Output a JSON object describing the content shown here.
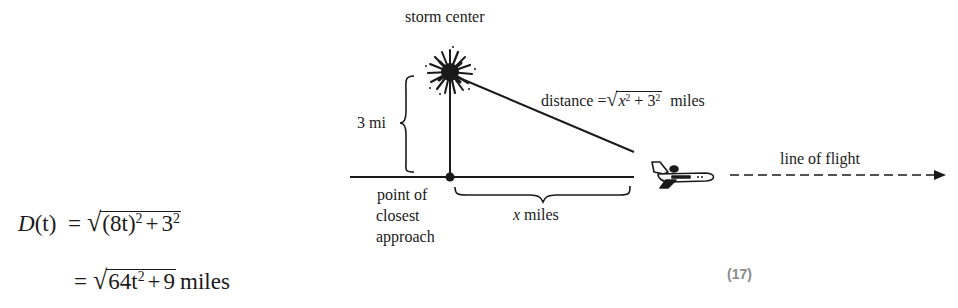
{
  "diagram": {
    "storm_label": "storm center",
    "vertical_distance_label": "3 mi",
    "distance_label_prefix": "distance =",
    "distance_radicand": {
      "x": "x",
      "x_exp": "2",
      "plus": "+",
      "three": "3",
      "three_exp": "2"
    },
    "distance_label_suffix": "miles",
    "closest_point_label": [
      "point of",
      "closest",
      "approach"
    ],
    "horizontal_distance_label": {
      "var": "x",
      "unit": "miles"
    },
    "flight_label": "line of flight",
    "icons": {
      "storm": "storm-burst-icon",
      "plane": "airplane-icon",
      "arrow": "arrow-right-icon"
    },
    "colors": {
      "ink": "#1a1a1a",
      "equation_number": "#8a8a8a",
      "background": "#ffffff"
    }
  },
  "equations": {
    "line1": {
      "lhs": "D",
      "lhs_arg": "(t)",
      "equals": "=",
      "radicand_a": "(8t)",
      "radicand_a_exp": "2",
      "plus": "+",
      "radicand_b": "3",
      "radicand_b_exp": "2"
    },
    "line2": {
      "equals": "=",
      "radicand_a": "64t",
      "radicand_a_exp": "2",
      "plus": "+",
      "radicand_b": "9",
      "unit": "miles"
    }
  },
  "equation_number": "(17)"
}
